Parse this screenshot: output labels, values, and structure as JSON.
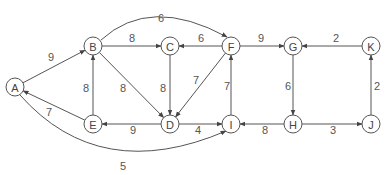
{
  "diagram": {
    "type": "directed-weighted-graph",
    "nodes": [
      {
        "id": "A",
        "x": 15,
        "y": 87
      },
      {
        "id": "B",
        "x": 93,
        "y": 46
      },
      {
        "id": "C",
        "x": 170,
        "y": 46
      },
      {
        "id": "D",
        "x": 170,
        "y": 124
      },
      {
        "id": "E",
        "x": 93,
        "y": 124
      },
      {
        "id": "F",
        "x": 231,
        "y": 46
      },
      {
        "id": "G",
        "x": 293,
        "y": 46
      },
      {
        "id": "H",
        "x": 293,
        "y": 124
      },
      {
        "id": "I",
        "x": 231,
        "y": 124
      },
      {
        "id": "J",
        "x": 371,
        "y": 124
      },
      {
        "id": "K",
        "x": 371,
        "y": 46
      }
    ],
    "edges": [
      {
        "from": "A",
        "to": "B",
        "weight": "9",
        "lx": 51,
        "ly": 57
      },
      {
        "from": "B",
        "to": "C",
        "weight": "8",
        "lx": 132,
        "ly": 38
      },
      {
        "from": "F",
        "to": "C",
        "weight": "6",
        "lx": 201,
        "ly": 38
      },
      {
        "from": "B",
        "to": "F",
        "weight": "6",
        "lx": 161,
        "ly": 18,
        "curve": "M 101 40 Q 150 -5 227 37"
      },
      {
        "from": "B",
        "to": "D",
        "weight": "8",
        "lx": 123,
        "ly": 88
      },
      {
        "from": "C",
        "to": "D",
        "weight": "8",
        "lx": 163,
        "ly": 88
      },
      {
        "from": "F",
        "to": "D",
        "weight": "7",
        "lx": 196,
        "ly": 80
      },
      {
        "from": "E",
        "to": "B",
        "weight": "8",
        "lx": 86,
        "ly": 88
      },
      {
        "from": "E",
        "to": "A",
        "weight": "7",
        "lx": 49,
        "ly": 112
      },
      {
        "from": "D",
        "to": "E",
        "weight": "9",
        "lx": 133,
        "ly": 130
      },
      {
        "from": "D",
        "to": "I",
        "weight": "4",
        "lx": 198,
        "ly": 130
      },
      {
        "from": "A",
        "to": "I",
        "weight": "5",
        "lx": 123,
        "ly": 166,
        "curve": "M 20 95 Q 100 185 226 131"
      },
      {
        "from": "I",
        "to": "F",
        "weight": "7",
        "lx": 227,
        "ly": 86
      },
      {
        "from": "F",
        "to": "G",
        "weight": "9",
        "lx": 261,
        "ly": 38
      },
      {
        "from": "K",
        "to": "G",
        "weight": "2",
        "lx": 336,
        "ly": 38
      },
      {
        "from": "G",
        "to": "H",
        "weight": "6",
        "lx": 288,
        "ly": 86
      },
      {
        "from": "H",
        "to": "I",
        "weight": "8",
        "lx": 265,
        "ly": 130
      },
      {
        "from": "H",
        "to": "J",
        "weight": "3",
        "lx": 333,
        "ly": 130
      },
      {
        "from": "J",
        "to": "K",
        "weight": "2",
        "lx": 377,
        "ly": 86
      }
    ]
  }
}
